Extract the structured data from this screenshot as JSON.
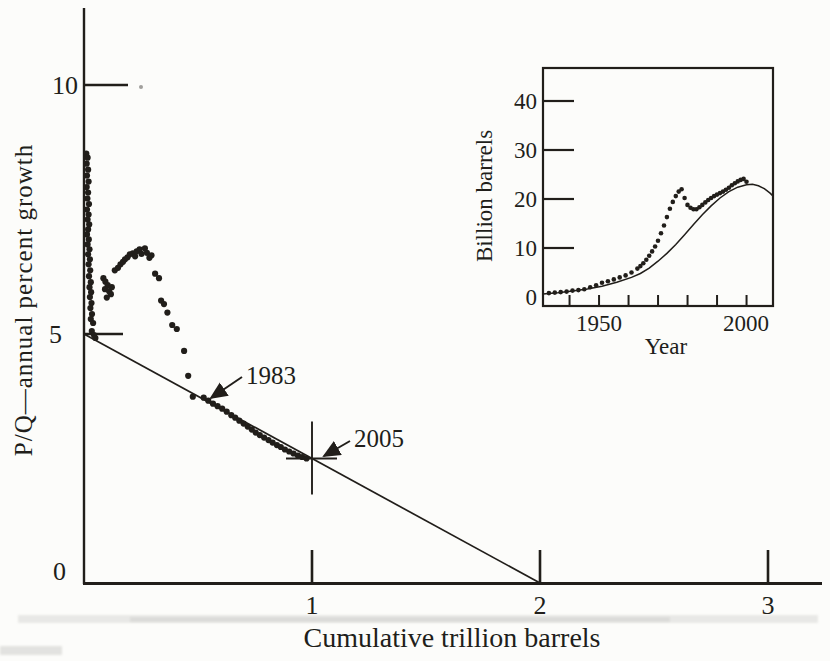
{
  "colors": {
    "ink": "#211e1a",
    "paper": "#fcfcfa",
    "artifact_gray": "#8b8b86"
  },
  "chart_data": [
    {
      "type": "scatter",
      "title": "",
      "xlabel": "Cumulative trillion barrels",
      "ylabel": "P/Q—annual percent growth",
      "xlim": [
        0,
        3.2
      ],
      "ylim": [
        0,
        11.5
      ],
      "xticks": [
        1,
        2,
        3
      ],
      "xtick_labels": [
        "1",
        "2",
        "3"
      ],
      "yticks": [
        5,
        10
      ],
      "ytick_labels": [
        "10",
        "5",
        "0"
      ],
      "grid": false,
      "legend": false,
      "annotations": [
        {
          "label": "1983",
          "target": [
            0.53,
            3.7
          ]
        },
        {
          "label": "2005",
          "target": [
            1.0,
            2.5
          ]
        }
      ],
      "series": [
        {
          "name": "P/Q versus cumulative production data",
          "type": "scatter",
          "points": [
            [
              0.01,
              8.62
            ],
            [
              0.016,
              8.54
            ],
            [
              0.012,
              8.42
            ],
            [
              0.018,
              8.3
            ],
            [
              0.013,
              8.18
            ],
            [
              0.02,
              8.06
            ],
            [
              0.012,
              7.95
            ],
            [
              0.018,
              7.84
            ],
            [
              0.015,
              7.72
            ],
            [
              0.022,
              7.61
            ],
            [
              0.013,
              7.5
            ],
            [
              0.02,
              7.4
            ],
            [
              0.016,
              7.3
            ],
            [
              0.023,
              7.2
            ],
            [
              0.018,
              7.1
            ],
            [
              0.013,
              7.0
            ],
            [
              0.021,
              6.9
            ],
            [
              0.016,
              6.8
            ],
            [
              0.024,
              6.7
            ],
            [
              0.018,
              6.6
            ],
            [
              0.026,
              6.5
            ],
            [
              0.02,
              6.4
            ],
            [
              0.027,
              6.28
            ],
            [
              0.022,
              6.16
            ],
            [
              0.03,
              6.04
            ],
            [
              0.024,
              5.94
            ],
            [
              0.031,
              5.84
            ],
            [
              0.026,
              5.74
            ],
            [
              0.033,
              5.62
            ],
            [
              0.028,
              5.52
            ],
            [
              0.035,
              5.4
            ],
            [
              0.03,
              5.3
            ],
            [
              0.04,
              5.22
            ],
            [
              0.034,
              5.06
            ],
            [
              0.044,
              4.98
            ],
            [
              0.05,
              4.92
            ],
            [
              0.085,
              6.12
            ],
            [
              0.094,
              6.05
            ],
            [
              0.104,
              5.98
            ],
            [
              0.092,
              5.9
            ],
            [
              0.11,
              5.86
            ],
            [
              0.118,
              5.8
            ],
            [
              0.1,
              5.73
            ],
            [
              0.122,
              5.94
            ],
            [
              0.135,
              6.28
            ],
            [
              0.149,
              6.33
            ],
            [
              0.16,
              6.4
            ],
            [
              0.171,
              6.45
            ],
            [
              0.18,
              6.5
            ],
            [
              0.191,
              6.54
            ],
            [
              0.201,
              6.6
            ],
            [
              0.214,
              6.62
            ],
            [
              0.224,
              6.56
            ],
            [
              0.231,
              6.66
            ],
            [
              0.244,
              6.7
            ],
            [
              0.252,
              6.61
            ],
            [
              0.267,
              6.72
            ],
            [
              0.276,
              6.63
            ],
            [
              0.287,
              6.53
            ],
            [
              0.296,
              6.58
            ],
            [
              0.312,
              6.21
            ],
            [
              0.329,
              6.12
            ],
            [
              0.338,
              5.67
            ],
            [
              0.351,
              5.6
            ],
            [
              0.366,
              5.43
            ],
            [
              0.387,
              5.18
            ],
            [
              0.407,
              5.1
            ],
            [
              0.439,
              4.66
            ],
            [
              0.457,
              4.16
            ],
            [
              0.477,
              3.74
            ],
            [
              0.525,
              3.72
            ],
            [
              0.545,
              3.66
            ],
            [
              0.566,
              3.6
            ],
            [
              0.586,
              3.55
            ],
            [
              0.606,
              3.5
            ],
            [
              0.626,
              3.44
            ],
            [
              0.646,
              3.37
            ],
            [
              0.663,
              3.32
            ],
            [
              0.681,
              3.26
            ],
            [
              0.7,
              3.2
            ],
            [
              0.718,
              3.14
            ],
            [
              0.736,
              3.08
            ],
            [
              0.753,
              3.02
            ],
            [
              0.771,
              2.97
            ],
            [
              0.79,
              2.92
            ],
            [
              0.809,
              2.87
            ],
            [
              0.827,
              2.82
            ],
            [
              0.846,
              2.77
            ],
            [
              0.863,
              2.73
            ],
            [
              0.881,
              2.68
            ],
            [
              0.9,
              2.64
            ],
            [
              0.919,
              2.6
            ],
            [
              0.938,
              2.56
            ],
            [
              0.957,
              2.53
            ],
            [
              0.976,
              2.5
            ]
          ]
        },
        {
          "name": "linear extrapolation line",
          "type": "line",
          "points": [
            [
              0,
              5
            ],
            [
              2,
              0
            ]
          ]
        },
        {
          "name": "2005 projection cross marker",
          "type": "cross",
          "point": [
            1.0,
            2.5
          ]
        }
      ]
    },
    {
      "type": "scatter",
      "title": "",
      "xlabel": "Year",
      "ylabel": "Billion barrels",
      "xlim": [
        1931,
        2009
      ],
      "ylim": [
        -2,
        46
      ],
      "xticks": [
        1940,
        1950,
        1960,
        1970,
        1980,
        1990,
        2000
      ],
      "xtick_labels": [
        "1950",
        "2000"
      ],
      "labeled_xticks": [
        1950,
        2000
      ],
      "yticks": [
        10,
        20,
        30,
        40
      ],
      "ytick_labels": [
        "40",
        "30",
        "20",
        "10",
        "0"
      ],
      "grid": false,
      "legend": false,
      "series": [
        {
          "name": "annual world production data",
          "type": "scatter",
          "points": [
            [
              1933,
              0.8
            ],
            [
              1935,
              0.9
            ],
            [
              1937,
              1.0
            ],
            [
              1939,
              1.1
            ],
            [
              1941,
              1.3
            ],
            [
              1943,
              1.4
            ],
            [
              1945,
              1.6
            ],
            [
              1947,
              2.0
            ],
            [
              1949,
              2.4
            ],
            [
              1951,
              2.9
            ],
            [
              1953,
              3.2
            ],
            [
              1955,
              3.6
            ],
            [
              1957,
              4.0
            ],
            [
              1959,
              4.4
            ],
            [
              1961,
              5.0
            ],
            [
              1963,
              5.8
            ],
            [
              1964,
              6.3
            ],
            [
              1965,
              6.9
            ],
            [
              1966,
              7.6
            ],
            [
              1967,
              8.4
            ],
            [
              1968,
              9.3
            ],
            [
              1969,
              10.3
            ],
            [
              1970,
              11.5
            ],
            [
              1971,
              13.0
            ],
            [
              1972,
              14.6
            ],
            [
              1973,
              16.3
            ],
            [
              1974,
              18.0
            ],
            [
              1975,
              19.4
            ],
            [
              1976,
              20.6
            ],
            [
              1977,
              21.5
            ],
            [
              1978,
              22.0
            ],
            [
              1979,
              20.2
            ],
            [
              1980,
              18.8
            ],
            [
              1981,
              18.2
            ],
            [
              1982,
              17.9
            ],
            [
              1983,
              17.9
            ],
            [
              1984,
              18.3
            ],
            [
              1985,
              18.8
            ],
            [
              1986,
              19.3
            ],
            [
              1987,
              19.8
            ],
            [
              1988,
              20.2
            ],
            [
              1989,
              20.6
            ],
            [
              1990,
              20.9
            ],
            [
              1991,
              21.2
            ],
            [
              1992,
              21.5
            ],
            [
              1993,
              21.9
            ],
            [
              1994,
              22.3
            ],
            [
              1995,
              22.8
            ],
            [
              1996,
              23.2
            ],
            [
              1997,
              23.6
            ],
            [
              1998,
              23.9
            ],
            [
              1999,
              24.1
            ],
            [
              2000,
              23.5
            ]
          ]
        },
        {
          "name": "logistic (Hubbert) curve",
          "type": "line",
          "points": [
            [
              1931,
              0.6
            ],
            [
              1936,
              0.85
            ],
            [
              1941,
              1.2
            ],
            [
              1946,
              1.65
            ],
            [
              1951,
              2.2
            ],
            [
              1956,
              3.0
            ],
            [
              1961,
              4.0
            ],
            [
              1964,
              4.8
            ],
            [
              1967,
              5.9
            ],
            [
              1970,
              7.3
            ],
            [
              1973,
              8.9
            ],
            [
              1976,
              10.7
            ],
            [
              1979,
              12.7
            ],
            [
              1982,
              14.8
            ],
            [
              1985,
              16.8
            ],
            [
              1988,
              18.6
            ],
            [
              1991,
              20.2
            ],
            [
              1994,
              21.5
            ],
            [
              1997,
              22.4
            ],
            [
              2000,
              22.9
            ],
            [
              2002,
              23.0
            ],
            [
              2004,
              22.7
            ],
            [
              2006,
              22.1
            ],
            [
              2008,
              21.2
            ],
            [
              2009,
              20.6
            ]
          ]
        }
      ]
    }
  ]
}
